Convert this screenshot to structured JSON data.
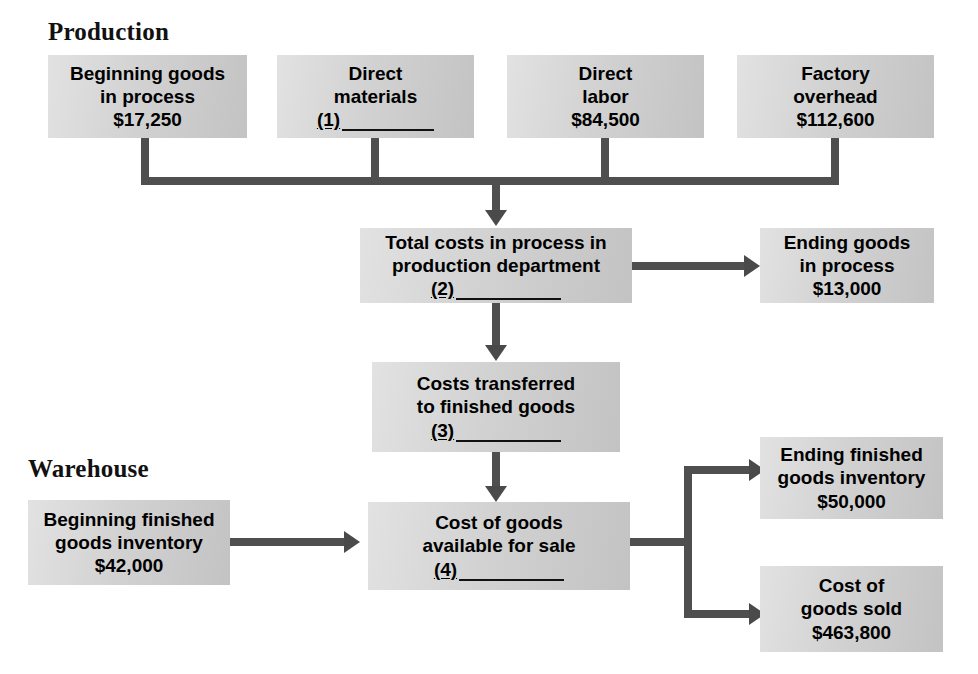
{
  "diagram": {
    "type": "flowchart",
    "sections": [
      {
        "id": "production",
        "label": "Production"
      },
      {
        "id": "warehouse",
        "label": "Warehouse"
      }
    ],
    "colors": {
      "box_fill_light": "#e2e2e2",
      "box_fill_dark": "#c3c3c3",
      "connector": "#4f4f4f",
      "text": "#000000",
      "background": "#ffffff"
    },
    "boxes": [
      {
        "id": "beginning-goods-in-process",
        "line1": "Beginning goods",
        "line2": "in process",
        "value": "$17,250",
        "blank": null
      },
      {
        "id": "direct-materials",
        "line1": "Direct",
        "line2": "materials",
        "value": null,
        "blank": "(1)"
      },
      {
        "id": "direct-labor",
        "line1": "Direct",
        "line2": "labor",
        "value": "$84,500",
        "blank": null
      },
      {
        "id": "factory-overhead",
        "line1": "Factory",
        "line2": "overhead",
        "value": "$112,600",
        "blank": null
      },
      {
        "id": "total-costs-in-process",
        "line1": "Total costs in process in",
        "line2": "production department",
        "value": null,
        "blank": "(2)"
      },
      {
        "id": "ending-goods-in-process",
        "line1": "Ending goods",
        "line2": "in process",
        "value": "$13,000",
        "blank": null
      },
      {
        "id": "costs-transferred-to-finished-goods",
        "line1": "Costs transferred",
        "line2": "to finished goods",
        "value": null,
        "blank": "(3)"
      },
      {
        "id": "beginning-finished-goods-inventory",
        "line1": "Beginning finished",
        "line2": "goods inventory",
        "value": "$42,000",
        "blank": null
      },
      {
        "id": "cost-of-goods-available-for-sale",
        "line1": "Cost of goods",
        "line2": "available for sale",
        "value": null,
        "blank": "(4)"
      },
      {
        "id": "ending-finished-goods-inventory",
        "line1": "Ending finished",
        "line2": "goods inventory",
        "value": "$50,000",
        "blank": null
      },
      {
        "id": "cost-of-goods-sold",
        "line1": "Cost of",
        "line2": "goods sold",
        "value": "$463,800",
        "blank": null
      }
    ]
  }
}
